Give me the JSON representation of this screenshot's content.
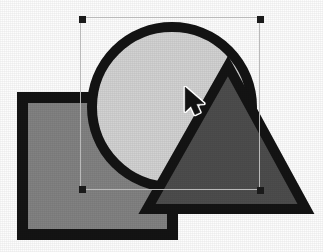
{
  "canvas": {
    "width": 323,
    "height": 252,
    "background_color": "#fdfdfd",
    "label": "drawing-canvas"
  },
  "shapes": [
    {
      "id": "rectangle",
      "name": "grey-rectangle",
      "type": "rect",
      "x": 17,
      "y": 92,
      "width": 161,
      "height": 148,
      "fill": "#828282",
      "stroke": "#141414",
      "stroke_width": 11,
      "selected": false
    },
    {
      "id": "circle",
      "name": "light-circle",
      "type": "circle",
      "cx": 172,
      "cy": 107,
      "r": 85,
      "fill": "#d2d2d2",
      "stroke": "#141414",
      "stroke_width": 10,
      "selected": true
    },
    {
      "id": "triangle",
      "name": "dark-triangle",
      "type": "polygon",
      "points": "228,66 306,209 147,209",
      "fill": "#4d4d4d",
      "stroke": "#141414",
      "stroke_width": 10,
      "selected": false
    }
  ],
  "selection": {
    "name": "selection-bounding-box",
    "target_shape": "circle",
    "x": 80,
    "y": 17,
    "width": 180,
    "height": 173,
    "frame_color": "#b9b9b9",
    "handle_color": "#1a1a1a",
    "handle_size": 7,
    "handles": [
      {
        "name": "handle-top-left",
        "x": 79,
        "y": 16,
        "cursor": "nwse-resize"
      },
      {
        "name": "handle-top-right",
        "x": 257,
        "y": 16,
        "cursor": "nesw-resize"
      },
      {
        "name": "handle-bottom-left",
        "x": 79,
        "y": 186,
        "cursor": "nesw-resize"
      },
      {
        "name": "handle-bottom-right",
        "x": 257,
        "y": 187,
        "cursor": "nwse-resize"
      }
    ]
  },
  "cursor": {
    "name": "mouse-pointer-cursor",
    "type": "arrow-pointer",
    "x": 183,
    "y": 86,
    "fill": "#121212",
    "outline": "#ffffff"
  }
}
